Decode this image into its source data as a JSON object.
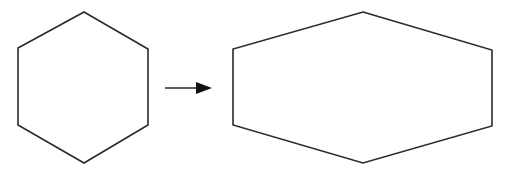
{
  "diagram": {
    "background": "#ffffff",
    "stroke_color": "#2a2a2a",
    "stroke_width": 1.6,
    "shapes": [
      {
        "id": "original-hexagon",
        "type": "regular-hexagon",
        "points": "84,12 148,49 148,125 84,163 18,125 18,48"
      },
      {
        "id": "stretched-hexagon",
        "type": "horizontally-stretched-hexagon",
        "points": "363,12 492,50 492,126 363,163 233,125 233,49"
      }
    ],
    "arrow": {
      "x1": 165,
      "y1": 88,
      "x2": 198,
      "y2": 88,
      "head_points": "196,82 212,88 196,94"
    }
  }
}
